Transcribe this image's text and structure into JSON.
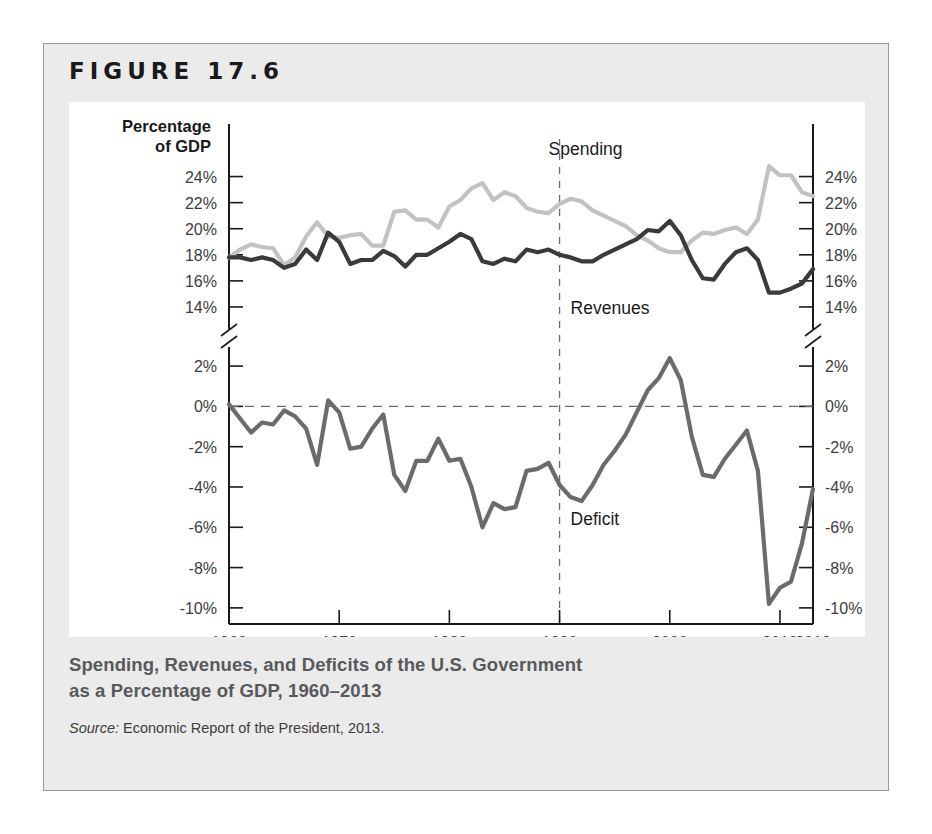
{
  "figure": {
    "label": "FIGURE 17.6",
    "caption_line1": "Spending, Revenues, and Deficits of the U.S. Government",
    "caption_line2": "as a Percentage of GDP, 1960–2013",
    "source_prefix": "Source:",
    "source_text": "Economic Report of the President, 2013."
  },
  "colors": {
    "card_bg": "#ebebeb",
    "plot_bg": "#ffffff",
    "border": "#9a9a9a",
    "spending_line": "#c2c2c2",
    "revenues_line": "#3a3a3a",
    "deficit_line": "#6b6b6b",
    "axis": "#1a1a1a",
    "tick_label": "#3d3d3d",
    "caption": "#58595b"
  },
  "chart_data": {
    "type": "line",
    "title": "Spending, Revenues, and Deficits of the U.S. Government as a Percentage of GDP, 1960–2013",
    "xlabel": "Year",
    "ylabel": "Percentage of GDP",
    "grid": false,
    "legend": "inline-annotations",
    "xlim": [
      1960,
      2013
    ],
    "xticks": [
      1960,
      1970,
      1980,
      1990,
      2000,
      2010,
      2013
    ],
    "xticklabels": [
      "1960",
      "1970",
      "1980",
      "1990",
      "2000",
      "2010",
      "2013"
    ],
    "panels": [
      {
        "name": "upper",
        "ylim": [
          13,
          25.5
        ],
        "yticks": [
          14,
          16,
          18,
          20,
          22,
          24
        ],
        "yticklabels": [
          "14%",
          "16%",
          "18%",
          "20%",
          "22%",
          "24%"
        ],
        "axis_break": true,
        "series": [
          {
            "name": "Spending",
            "color": "#c2c2c2",
            "annotation": "Spending",
            "x": [
              1960,
              1961,
              1962,
              1963,
              1964,
              1965,
              1966,
              1967,
              1968,
              1969,
              1970,
              1971,
              1972,
              1973,
              1974,
              1975,
              1976,
              1977,
              1978,
              1979,
              1980,
              1981,
              1982,
              1983,
              1984,
              1985,
              1986,
              1987,
              1988,
              1989,
              1990,
              1991,
              1992,
              1993,
              1994,
              1995,
              1996,
              1997,
              1998,
              1999,
              2000,
              2001,
              2002,
              2003,
              2004,
              2005,
              2006,
              2007,
              2008,
              2009,
              2010,
              2011,
              2012,
              2013
            ],
            "values": [
              17.8,
              18.4,
              18.8,
              18.6,
              18.5,
              17.2,
              17.8,
              19.4,
              20.5,
              19.4,
              19.3,
              19.5,
              19.6,
              18.7,
              18.7,
              21.3,
              21.4,
              20.7,
              20.7,
              20.1,
              21.7,
              22.2,
              23.1,
              23.5,
              22.2,
              22.8,
              22.5,
              21.6,
              21.3,
              21.2,
              21.9,
              22.3,
              22.1,
              21.4,
              21.0,
              20.6,
              20.2,
              19.5,
              19.1,
              18.5,
              18.2,
              18.2,
              19.1,
              19.7,
              19.6,
              19.9,
              20.1,
              19.6,
              20.7,
              24.8,
              24.1,
              24.1,
              22.8,
              22.5
            ]
          },
          {
            "name": "Revenues",
            "color": "#3a3a3a",
            "annotation": "Revenues",
            "x": [
              1960,
              1961,
              1962,
              1963,
              1964,
              1965,
              1966,
              1967,
              1968,
              1969,
              1970,
              1971,
              1972,
              1973,
              1974,
              1975,
              1976,
              1977,
              1978,
              1979,
              1980,
              1981,
              1982,
              1983,
              1984,
              1985,
              1986,
              1987,
              1988,
              1989,
              1990,
              1991,
              1992,
              1993,
              1994,
              1995,
              1996,
              1997,
              1998,
              1999,
              2000,
              2001,
              2002,
              2003,
              2004,
              2005,
              2006,
              2007,
              2008,
              2009,
              2010,
              2011,
              2012,
              2013
            ],
            "values": [
              17.8,
              17.8,
              17.6,
              17.8,
              17.6,
              17.0,
              17.3,
              18.4,
              17.6,
              19.7,
              19.0,
              17.3,
              17.6,
              17.6,
              18.3,
              17.9,
              17.1,
              18.0,
              18.0,
              18.5,
              19.0,
              19.6,
              19.2,
              17.5,
              17.3,
              17.7,
              17.5,
              18.4,
              18.2,
              18.4,
              18.0,
              17.8,
              17.5,
              17.5,
              18.0,
              18.4,
              18.8,
              19.2,
              19.9,
              19.8,
              20.6,
              19.5,
              17.6,
              16.2,
              16.1,
              17.3,
              18.2,
              18.5,
              17.6,
              15.1,
              15.1,
              15.4,
              15.8,
              16.9
            ]
          }
        ]
      },
      {
        "name": "lower",
        "ylim": [
          -10.8,
          2.6
        ],
        "yticks": [
          2,
          0,
          -2,
          -4,
          -6,
          -8,
          -10
        ],
        "yticklabels": [
          "2%",
          "0%",
          "-2%",
          "-4%",
          "-6%",
          "-8%",
          "-10%"
        ],
        "zero_line": true,
        "series": [
          {
            "name": "Deficit",
            "color": "#6b6b6b",
            "annotation": "Deficit",
            "x": [
              1960,
              1961,
              1962,
              1963,
              1964,
              1965,
              1966,
              1967,
              1968,
              1969,
              1970,
              1971,
              1972,
              1973,
              1974,
              1975,
              1976,
              1977,
              1978,
              1979,
              1980,
              1981,
              1982,
              1983,
              1984,
              1985,
              1986,
              1987,
              1988,
              1989,
              1990,
              1991,
              1992,
              1993,
              1994,
              1995,
              1996,
              1997,
              1998,
              1999,
              2000,
              2001,
              2002,
              2003,
              2004,
              2005,
              2006,
              2007,
              2008,
              2009,
              2010,
              2011,
              2012,
              2013
            ],
            "values": [
              0.1,
              -0.6,
              -1.3,
              -0.8,
              -0.9,
              -0.2,
              -0.5,
              -1.1,
              -2.9,
              0.3,
              -0.3,
              -2.1,
              -2.0,
              -1.1,
              -0.4,
              -3.4,
              -4.2,
              -2.7,
              -2.7,
              -1.6,
              -2.7,
              -2.6,
              -4.0,
              -6.0,
              -4.8,
              -5.1,
              -5.0,
              -3.2,
              -3.1,
              -2.8,
              -3.9,
              -4.5,
              -4.7,
              -3.9,
              -2.9,
              -2.2,
              -1.4,
              -0.3,
              0.8,
              1.4,
              2.4,
              1.3,
              -1.5,
              -3.4,
              -3.5,
              -2.6,
              -1.9,
              -1.2,
              -3.2,
              -9.8,
              -9.0,
              -8.7,
              -6.8,
              -4.1
            ]
          }
        ]
      }
    ]
  }
}
